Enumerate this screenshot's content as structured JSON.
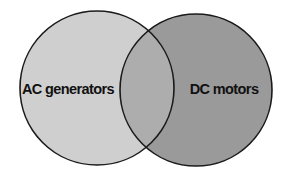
{
  "diagram": {
    "type": "venn",
    "sets": [
      {
        "id": "left",
        "label": "AC generators",
        "fill": "#cfcfcf",
        "stroke": "#1a1a1a",
        "cx": 97,
        "cy": 88,
        "r": 77
      },
      {
        "id": "right",
        "label": "DC motors",
        "fill": "#9a9a9a",
        "stroke": "#1a1a1a",
        "cx": 196,
        "cy": 90,
        "r": 76
      }
    ],
    "overlap": {
      "fill": "#adadad",
      "label": ""
    }
  }
}
